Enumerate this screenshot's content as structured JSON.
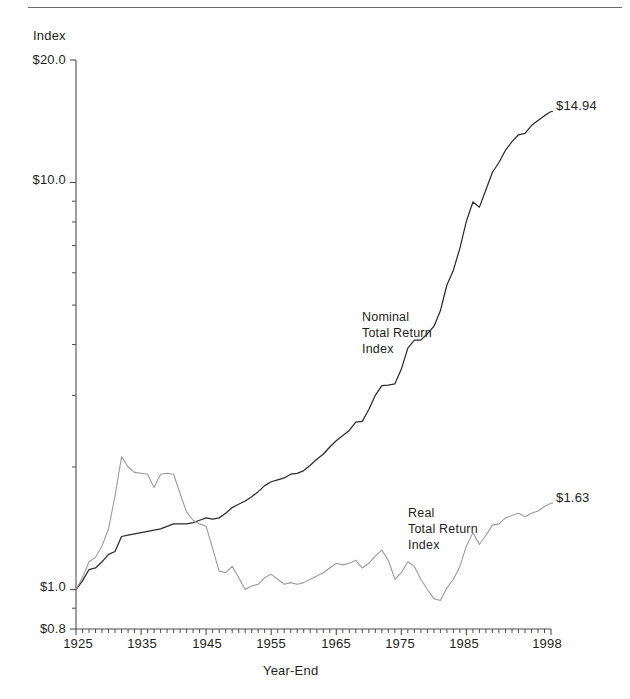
{
  "figure": {
    "y_axis_title": "Index",
    "x_axis_title": "Year-End"
  },
  "annotations": {
    "nominal": {
      "line1": "Nominal",
      "line2": "Total Return",
      "line3": "Index"
    },
    "real": {
      "line1": "Real",
      "line2": "Total Return",
      "line3": "Index"
    },
    "nominal_end_value": "$14.94",
    "real_end_value": "$1.63"
  },
  "colors": {
    "nominal_line": "#2b2b2b",
    "real_line": "#9a9a9a",
    "axis": "#4d4d4d",
    "rule": "#6e6e6e",
    "text": "#231f20"
  },
  "chart_data": {
    "type": "line",
    "title": "",
    "xlabel": "Year-End",
    "ylabel": "Index",
    "yscale": "log",
    "ylim": [
      0.8,
      20.0
    ],
    "xlim": [
      1925,
      1998
    ],
    "grid": false,
    "legend": "inline-annotations",
    "ytick_labels": [
      "$20.0",
      "$10.0",
      "$1.0",
      "$0.8"
    ],
    "ytick_values": [
      20.0,
      10.0,
      1.0,
      0.8
    ],
    "yminor_ticks": [
      9,
      8,
      7,
      6,
      5,
      4,
      3,
      2,
      0.9
    ],
    "xtick_labels": [
      "1925",
      "1935",
      "1945",
      "1955",
      "1965",
      "1975",
      "1985",
      "1998"
    ],
    "xtick_values": [
      1925,
      1935,
      1945,
      1955,
      1965,
      1975,
      1985,
      1998
    ],
    "xminor_tick_step": 1,
    "x": [
      1925,
      1926,
      1927,
      1928,
      1929,
      1930,
      1931,
      1932,
      1933,
      1934,
      1935,
      1936,
      1937,
      1938,
      1939,
      1940,
      1941,
      1942,
      1943,
      1944,
      1945,
      1946,
      1947,
      1948,
      1949,
      1950,
      1951,
      1952,
      1953,
      1954,
      1955,
      1956,
      1957,
      1958,
      1959,
      1960,
      1961,
      1962,
      1963,
      1964,
      1965,
      1966,
      1967,
      1968,
      1969,
      1970,
      1971,
      1972,
      1973,
      1974,
      1975,
      1976,
      1977,
      1978,
      1979,
      1980,
      1981,
      1982,
      1983,
      1984,
      1985,
      1986,
      1987,
      1988,
      1989,
      1990,
      1991,
      1992,
      1993,
      1994,
      1995,
      1996,
      1997,
      1998
    ],
    "series": [
      {
        "name": "Nominal Total Return Index",
        "label_lines": [
          "Nominal",
          "Total Return",
          "Index"
        ],
        "color": "#2b2b2b",
        "end_label": "$14.94",
        "values": [
          1.0,
          1.05,
          1.12,
          1.13,
          1.17,
          1.22,
          1.24,
          1.35,
          1.36,
          1.37,
          1.38,
          1.39,
          1.4,
          1.41,
          1.43,
          1.45,
          1.45,
          1.45,
          1.46,
          1.48,
          1.5,
          1.49,
          1.5,
          1.54,
          1.59,
          1.62,
          1.65,
          1.69,
          1.74,
          1.8,
          1.84,
          1.86,
          1.88,
          1.92,
          1.93,
          1.96,
          2.02,
          2.09,
          2.15,
          2.24,
          2.32,
          2.39,
          2.46,
          2.58,
          2.59,
          2.77,
          3.0,
          3.17,
          3.18,
          3.2,
          3.48,
          3.92,
          4.1,
          4.1,
          4.25,
          4.43,
          4.84,
          5.6,
          6.09,
          6.9,
          8.04,
          8.96,
          8.7,
          9.6,
          10.6,
          11.2,
          12.0,
          12.6,
          13.1,
          13.2,
          13.8,
          14.2,
          14.6,
          14.94
        ]
      },
      {
        "name": "Real Total Return Index",
        "label_lines": [
          "Real",
          "Total Return",
          "Index"
        ],
        "color": "#9a9a9a",
        "end_label": "$1.63",
        "values": [
          1.0,
          1.07,
          1.17,
          1.2,
          1.28,
          1.41,
          1.7,
          2.12,
          2.0,
          1.94,
          1.93,
          1.92,
          1.78,
          1.92,
          1.93,
          1.92,
          1.72,
          1.55,
          1.48,
          1.45,
          1.43,
          1.26,
          1.11,
          1.1,
          1.14,
          1.07,
          1.0,
          1.02,
          1.03,
          1.07,
          1.09,
          1.06,
          1.03,
          1.04,
          1.03,
          1.04,
          1.06,
          1.08,
          1.1,
          1.13,
          1.16,
          1.15,
          1.16,
          1.18,
          1.13,
          1.16,
          1.21,
          1.25,
          1.18,
          1.06,
          1.1,
          1.17,
          1.14,
          1.06,
          1.0,
          0.95,
          0.94,
          1.01,
          1.06,
          1.14,
          1.28,
          1.38,
          1.29,
          1.36,
          1.44,
          1.45,
          1.5,
          1.52,
          1.54,
          1.51,
          1.54,
          1.56,
          1.6,
          1.63
        ]
      }
    ]
  }
}
